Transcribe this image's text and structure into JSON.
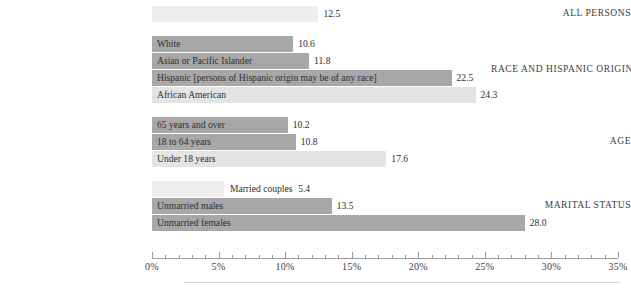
{
  "chart_data": {
    "type": "bar",
    "orientation": "horizontal",
    "title": "",
    "xlabel": "",
    "ylabel": "",
    "xlim": [
      0,
      35
    ],
    "xunit": "%",
    "grid": false,
    "legend": "none",
    "axis": {
      "major_ticks": [
        0,
        5,
        10,
        15,
        20,
        25,
        30,
        35
      ],
      "major_tick_labels": [
        "0%",
        "5%",
        "10%",
        "15%",
        "20%",
        "25%",
        "30%",
        "35%"
      ],
      "minor_tick_interval": 1
    },
    "groups": [
      {
        "name": "ALL PERSONS",
        "bars": [
          {
            "label": "",
            "value": 12.5,
            "value_text": "12.5",
            "shade": "faint",
            "label_position": "none"
          }
        ]
      },
      {
        "name": "RACE AND HISPANIC ORIGIN",
        "bars": [
          {
            "label": "White",
            "value": 10.6,
            "value_text": "10.6",
            "shade": "dark",
            "label_position": "inside"
          },
          {
            "label": "Asian or Pacific Islander",
            "value": 11.8,
            "value_text": "11.8",
            "shade": "dark",
            "label_position": "inside"
          },
          {
            "label": "Hispanic [persons of Hispanic origin may be of any race]",
            "value": 22.5,
            "value_text": "22.5",
            "shade": "dark",
            "label_position": "inside"
          },
          {
            "label": "African American",
            "value": 24.3,
            "value_text": "24.3",
            "shade": "light",
            "label_position": "inside"
          }
        ]
      },
      {
        "name": "AGE",
        "bars": [
          {
            "label": "65 years and over",
            "value": 10.2,
            "value_text": "10.2",
            "shade": "dark",
            "label_position": "inside"
          },
          {
            "label": "18 to 64 years",
            "value": 10.8,
            "value_text": "10.8",
            "shade": "dark",
            "label_position": "inside"
          },
          {
            "label": "Under 18 years",
            "value": 17.6,
            "value_text": "17.6",
            "shade": "light",
            "label_position": "inside"
          }
        ]
      },
      {
        "name": "MARITAL STATUS",
        "bars": [
          {
            "label": "Married couples",
            "value": 5.4,
            "value_text": "5.4",
            "shade": "faint",
            "label_position": "outside-joined"
          },
          {
            "label": "Unmarried males",
            "value": 13.5,
            "value_text": "13.5",
            "shade": "dark",
            "label_position": "inside"
          },
          {
            "label": "Unmarried females",
            "value": 28.0,
            "value_text": "28.0",
            "shade": "dark",
            "label_position": "inside"
          }
        ]
      }
    ],
    "colors": {
      "bar_dark": "#a8a8a8",
      "bar_light": "#e4e4e4",
      "bar_faint": "#efefef",
      "axis": "#9a9a9a",
      "text": "#3c3c3c",
      "rule": "#d8d8d8"
    }
  }
}
